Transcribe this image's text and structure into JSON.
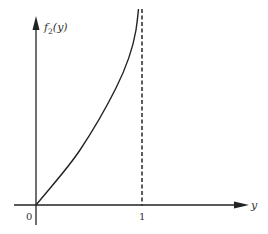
{
  "diagram": {
    "y_axis_label": "f",
    "y_axis_label_sub": "2",
    "y_axis_label_arg": "(y)",
    "x_axis_label": "y",
    "origin_label": "0",
    "asymptote_tick_label": "1",
    "colors": {
      "line": "#222222",
      "text": "#333333",
      "background": "#ffffff"
    }
  }
}
